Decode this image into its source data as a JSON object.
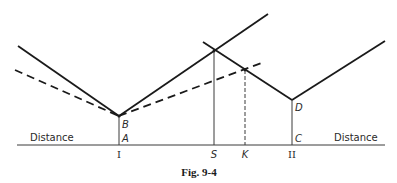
{
  "figure": {
    "caption": "Fig. 9-4",
    "axis": {
      "left_label": "Distance",
      "right_label": "Distance",
      "ticks": [
        {
          "id": "I",
          "label": "I",
          "x": 119
        },
        {
          "id": "S",
          "label": "S",
          "x": 214
        },
        {
          "id": "K",
          "label": "K",
          "x": 245
        },
        {
          "id": "II",
          "label": "II",
          "x": 292
        }
      ]
    },
    "points": [
      {
        "id": "A",
        "label": "A"
      },
      {
        "id": "B",
        "label": "B"
      },
      {
        "id": "C",
        "label": "C"
      },
      {
        "id": "D",
        "label": "D"
      }
    ],
    "lines": {
      "solid_from_B": "solid V-shaped cost line with vertex at B above I",
      "dashed_from_B": "dashed V-shaped cost line with vertex at B above I",
      "solid_from_D": "solid V-shaped cost line with vertex at D above II",
      "S_drop": "solid vertical from intersection down to S",
      "K_drop": "dashed vertical from intersection down to K"
    },
    "colors": {
      "line": "#1a1a1a",
      "thin_line": "#3a3a3a",
      "background": "#ffffff"
    }
  }
}
